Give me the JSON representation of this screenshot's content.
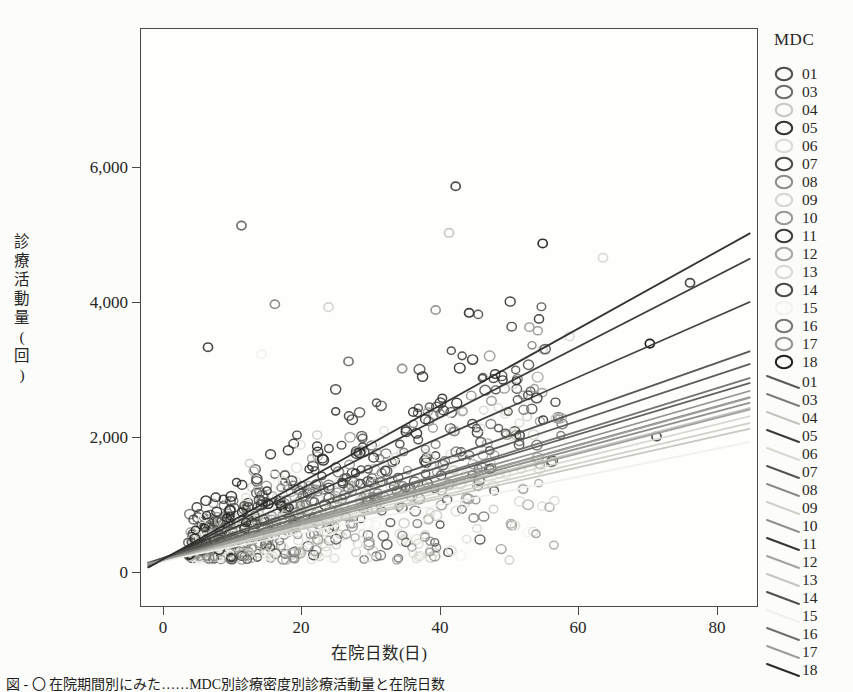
{
  "figure": {
    "background_color": "#fcfcfa",
    "frame_color": "#4a4a48",
    "caption": "図  ‐  〇  在院期間別にみた……MDC別診療密度別診療活動量と在院日数"
  },
  "axes": {
    "x_title": "在院日数(日)",
    "y_title_chars": [
      "診",
      "療",
      "活",
      "動",
      "量",
      "(",
      "回",
      ")"
    ],
    "x_ticks": [
      "0",
      "20",
      "40",
      "60",
      "80"
    ],
    "y_ticks": [
      "0",
      "2,000",
      "4,000",
      "6,000"
    ]
  },
  "legend": {
    "title": "MDC",
    "marker_items": [
      {
        "label": "01",
        "color": "#4e4e4c"
      },
      {
        "label": "03",
        "color": "#6e6e6b"
      },
      {
        "label": "04",
        "color": "#c9c9c2"
      },
      {
        "label": "05",
        "color": "#33332f"
      },
      {
        "label": "06",
        "color": "#dcdcd4"
      },
      {
        "label": "07",
        "color": "#4a4a47"
      },
      {
        "label": "08",
        "color": "#8e8e8a"
      },
      {
        "label": "09",
        "color": "#d6d6ce"
      },
      {
        "label": "10",
        "color": "#9a9a95"
      },
      {
        "label": "11",
        "color": "#3c3c39"
      },
      {
        "label": "12",
        "color": "#a7a7a1"
      },
      {
        "label": "13",
        "color": "#dadad2"
      },
      {
        "label": "14",
        "color": "#4a4a47"
      },
      {
        "label": "15",
        "color": "#f2f2ee"
      },
      {
        "label": "16",
        "color": "#777774"
      },
      {
        "label": "17",
        "color": "#949490"
      },
      {
        "label": "18",
        "color": "#232321"
      }
    ],
    "line_items": [
      {
        "label": "01",
        "color": "#5a5a57"
      },
      {
        "label": "03",
        "color": "#7d7d79"
      },
      {
        "label": "04",
        "color": "#c4c4bd"
      },
      {
        "label": "05",
        "color": "#3a3a37"
      },
      {
        "label": "06",
        "color": "#d8d8d0"
      },
      {
        "label": "07",
        "color": "#55554f"
      },
      {
        "label": "08",
        "color": "#8b8b86"
      },
      {
        "label": "09",
        "color": "#cfcfc7"
      },
      {
        "label": "10",
        "color": "#8f8f8a"
      },
      {
        "label": "11",
        "color": "#343431"
      },
      {
        "label": "12",
        "color": "#a2a29c"
      },
      {
        "label": "13",
        "color": "#c6c6bf"
      },
      {
        "label": "14",
        "color": "#4f4f4c"
      },
      {
        "label": "15",
        "color": "#f0f0ec"
      },
      {
        "label": "16",
        "color": "#6f6f6b"
      },
      {
        "label": "17",
        "color": "#9d9d98"
      },
      {
        "label": "18",
        "color": "#2a2a28"
      }
    ]
  },
  "chart_data": {
    "type": "scatter",
    "title": "",
    "xlabel": "在院日数(日)",
    "ylabel": "診療活動量(回)",
    "xlim": [
      -6,
      86
    ],
    "ylim": [
      -620,
      7450
    ],
    "grid": false,
    "legend_position": "right",
    "legend_title": "MDC",
    "marker": "open-circle",
    "series_names": [
      "01",
      "03",
      "04",
      "05",
      "06",
      "07",
      "08",
      "09",
      "10",
      "11",
      "12",
      "13",
      "14",
      "15",
      "16",
      "17",
      "18"
    ],
    "series_colors": [
      "#4e4e4c",
      "#6e6e6b",
      "#c9c9c2",
      "#33332f",
      "#dcdcd4",
      "#4a4a47",
      "#8e8e8a",
      "#d6d6ce",
      "#9a9a95",
      "#3c3c39",
      "#a7a7a1",
      "#dadad2",
      "#4a4a47",
      "#f2f2ee",
      "#777774",
      "#949490",
      "#232321"
    ],
    "regression_lines": [
      {
        "name": "01",
        "intercept": 120,
        "slope": 28,
        "color": "#5a5a57"
      },
      {
        "name": "03",
        "intercept": 90,
        "slope": 26,
        "color": "#7d7d79"
      },
      {
        "name": "04",
        "intercept": 110,
        "slope": 24,
        "color": "#c4c4bd"
      },
      {
        "name": "05",
        "intercept": 150,
        "slope": 41,
        "color": "#3a3a37"
      },
      {
        "name": "06",
        "intercept": 80,
        "slope": 23,
        "color": "#d8d8d0"
      },
      {
        "name": "07",
        "intercept": 130,
        "slope": 31,
        "color": "#55554f"
      },
      {
        "name": "08",
        "intercept": 100,
        "slope": 25,
        "color": "#8b8b86"
      },
      {
        "name": "09",
        "intercept": 70,
        "slope": 22,
        "color": "#cfcfc7"
      },
      {
        "name": "10",
        "intercept": 95,
        "slope": 27,
        "color": "#8f8f8a"
      },
      {
        "name": "11",
        "intercept": 160,
        "slope": 48,
        "color": "#343431"
      },
      {
        "name": "12",
        "intercept": 85,
        "slope": 26,
        "color": "#a2a29c"
      },
      {
        "name": "13",
        "intercept": 75,
        "slope": 21,
        "color": "#c6c6bf"
      },
      {
        "name": "14",
        "intercept": 140,
        "slope": 33,
        "color": "#4f4f4c"
      },
      {
        "name": "15",
        "intercept": 60,
        "slope": 19,
        "color": "#f0f0ec"
      },
      {
        "name": "16",
        "intercept": 105,
        "slope": 29,
        "color": "#6f6f6b"
      },
      {
        "name": "17",
        "intercept": 88,
        "slope": 24,
        "color": "#9d9d98"
      },
      {
        "name": "18",
        "intercept": 175,
        "slope": 52,
        "color": "#2a2a28"
      }
    ],
    "notable_points": [
      {
        "x": 41,
        "y": 5250
      },
      {
        "x": 9,
        "y": 4700
      },
      {
        "x": 40,
        "y": 4600
      },
      {
        "x": 54,
        "y": 4450
      },
      {
        "x": 63,
        "y": 4250
      },
      {
        "x": 76,
        "y": 3900
      },
      {
        "x": 14,
        "y": 3600
      },
      {
        "x": 22,
        "y": 3560
      },
      {
        "x": 38,
        "y": 3520
      },
      {
        "x": 43,
        "y": 3480
      },
      {
        "x": 52,
        "y": 3280
      },
      {
        "x": 58,
        "y": 3150
      },
      {
        "x": 4,
        "y": 3000
      },
      {
        "x": 12,
        "y": 2900
      },
      {
        "x": 25,
        "y": 2800
      },
      {
        "x": 33,
        "y": 2700
      },
      {
        "x": 70,
        "y": 3050
      },
      {
        "x": 71,
        "y": 1750
      }
    ],
    "n_points_approx": 900
  }
}
